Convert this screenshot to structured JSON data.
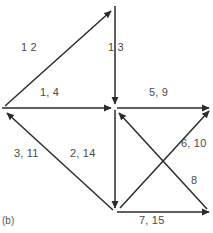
{
  "figure": {
    "caption": "(b)",
    "stroke_color": "#2b2b2b",
    "label_color": "#4a4a4a",
    "background": "#ffffff",
    "width": 213,
    "height": 233
  },
  "nodes": [
    {
      "id": "top",
      "name": "node-top",
      "x": 115,
      "y": 8
    },
    {
      "id": "center",
      "name": "node-center",
      "x": 115,
      "y": 108
    },
    {
      "id": "bottom",
      "name": "node-bottom",
      "x": 115,
      "y": 212
    },
    {
      "id": "left",
      "name": "node-left",
      "x": 4,
      "y": 108
    },
    {
      "id": "right",
      "name": "node-right",
      "x": 208,
      "y": 108
    },
    {
      "id": "bottom_right",
      "name": "node-bottom-right",
      "x": 208,
      "y": 212
    }
  ],
  "edges": [
    {
      "id": "e_left_top",
      "label": "1  2",
      "from": "left",
      "to": "top",
      "direction": "up-right"
    },
    {
      "id": "e_top_center",
      "label": "1  3",
      "from": "top",
      "to": "center",
      "direction": "down"
    },
    {
      "id": "e_left_center",
      "label": "1, 4",
      "from": "left",
      "to": "center",
      "direction": "right"
    },
    {
      "id": "e_center_right",
      "label": "5, 9",
      "from": "center",
      "to": "right",
      "direction": "right"
    },
    {
      "id": "e_bottom_left",
      "label": "3, 11",
      "from": "bottom",
      "to": "left",
      "direction": "up-left"
    },
    {
      "id": "e_center_bottom",
      "label": "2, 14",
      "from": "center",
      "to": "bottom",
      "direction": "down"
    },
    {
      "id": "e_bottomright_center",
      "label": "6, 10",
      "from": "bottom_right",
      "to": "center",
      "direction": "up-left"
    },
    {
      "id": "e_center_bottomright",
      "label": "8",
      "from": "center",
      "to": "bottom_right",
      "direction": "down-right"
    },
    {
      "id": "e_bottom_bottomright",
      "label": "7, 15",
      "from": "bottom",
      "to": "bottom_right",
      "direction": "right"
    }
  ],
  "edge_labels": {
    "left_top": "1  2",
    "top_center": "1  3",
    "left_center": "1, 4",
    "center_right": "5, 9",
    "bottom_left": "3, 11",
    "center_bottom": "2, 14",
    "bottomright_center": "6, 10",
    "center_bottomright": "8",
    "bottom_bottomright": "7, 15"
  }
}
